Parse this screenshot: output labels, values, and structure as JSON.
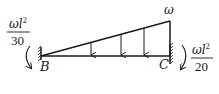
{
  "diagram": {
    "type": "fixed-fixed beam with triangular distributed load",
    "load": {
      "label": "ω",
      "shape": "triangular",
      "zero_at": "B",
      "max_at": "C",
      "arrow_count": 3
    },
    "supports": [
      {
        "id": "B",
        "label": "B",
        "type": "fixed",
        "side": "left"
      },
      {
        "id": "C",
        "label": "C",
        "type": "fixed",
        "side": "right"
      }
    ],
    "moments": [
      {
        "at": "B",
        "numerator": "ωl",
        "exponent": "2",
        "denominator": "30",
        "direction": "counterclockwise"
      },
      {
        "at": "C",
        "numerator": "ωl",
        "exponent": "2",
        "denominator": "20",
        "direction": "clockwise"
      }
    ]
  }
}
